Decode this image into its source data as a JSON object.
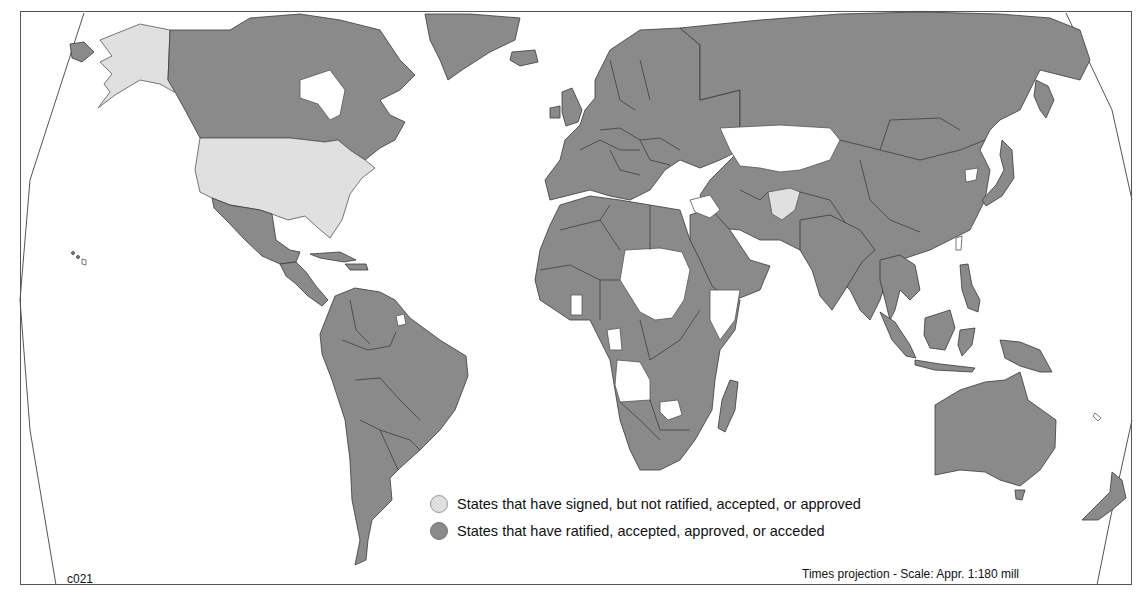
{
  "map": {
    "code": "c021",
    "projection_note": "Times projection - Scale: Appr. 1:180 mill",
    "colors": {
      "ratified": "#8a8a8a",
      "signed": "#e0e0e0",
      "none": "#ffffff",
      "border": "#3a3a3a"
    }
  },
  "legend": {
    "items": [
      {
        "status": "signed",
        "label": "States that have signed, but not ratified, accepted, or approved",
        "color": "#e0e0e0"
      },
      {
        "status": "ratified",
        "label": "States that have ratified, accepted, approved, or acceded",
        "color": "#8a8a8a"
      }
    ]
  },
  "regions": {
    "signed": [
      "United States (incl. Alaska)",
      "Afghanistan"
    ],
    "none": [
      "Kazakhstan",
      "Uzbekistan",
      "Turkmenistan area",
      "Sudan",
      "Chad",
      "Central African Republic",
      "Somalia",
      "Angola",
      "Zimbabwe",
      "Ghana",
      "Guinea-Bissau",
      "Sierra Leone",
      "Gabon/Congo",
      "Libya (north coast)",
      "Iraq",
      "Jordan area",
      "Kuwait/UAE",
      "North Korea",
      "Myanmar",
      "French Guiana",
      "Taiwan",
      "Cuba outline",
      "Haiti outline",
      "New Caledonia",
      "Hawaii"
    ]
  }
}
